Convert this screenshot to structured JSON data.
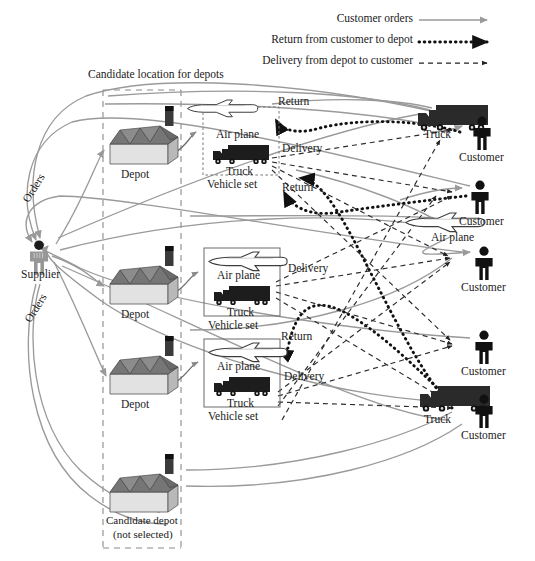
{
  "legend": {
    "items": [
      {
        "label": "Customer orders",
        "style": "solid-gray-arrow",
        "color": "#9a9a9a"
      },
      {
        "label": "Return from customer to depot",
        "style": "thick-dotted-black-arrow",
        "color": "#111111"
      },
      {
        "label": "Delivery from depot to customer",
        "style": "thin-dashed-black-arrow",
        "color": "#222222"
      }
    ]
  },
  "zone": {
    "title": "Candidate location for depots"
  },
  "supplier": {
    "label": "Supplier",
    "icon": "person-icon",
    "color": "#8d8d8d"
  },
  "order_labels": [
    {
      "label": "Orders"
    },
    {
      "label": "Orders"
    }
  ],
  "depots": [
    {
      "label": "Depot",
      "icon": "factory-icon",
      "selected": true
    },
    {
      "label": "Depot",
      "icon": "factory-icon",
      "selected": true
    },
    {
      "label": "Depot",
      "icon": "factory-icon",
      "selected": true
    },
    {
      "label": "Candidate depot",
      "sublabel": "(not selected)",
      "icon": "factory-icon",
      "selected": false
    }
  ],
  "vehicle_sets": [
    {
      "caption": "Vehicle set",
      "air_label": "Air plane",
      "truck_label": "Truck",
      "border": "dashed"
    },
    {
      "caption": "Vehicle set",
      "air_label": "Air plane",
      "truck_label": "Truck",
      "border": "solid"
    },
    {
      "caption": "Vehicle set",
      "air_label": "Air plane",
      "truck_label": "Truck",
      "border": "solid"
    }
  ],
  "flow_labels": [
    {
      "label": "Return",
      "kind": "return"
    },
    {
      "label": "Delivery",
      "kind": "delivery"
    },
    {
      "label": "Return",
      "kind": "return"
    },
    {
      "label": "Delivery",
      "kind": "delivery"
    },
    {
      "label": "Return",
      "kind": "return"
    },
    {
      "label": "Delivery",
      "kind": "delivery"
    }
  ],
  "field_vehicles": [
    {
      "label": "Truck",
      "icon": "truck-icon"
    },
    {
      "label": "Air plane",
      "icon": "airplane-icon"
    },
    {
      "label": "Truck",
      "icon": "truck-icon"
    }
  ],
  "customers": [
    {
      "label": "Customer",
      "icon": "person-icon"
    },
    {
      "label": "Customer",
      "icon": "person-icon"
    },
    {
      "label": "Customer",
      "icon": "person-icon"
    },
    {
      "label": "Customer",
      "icon": "person-icon"
    },
    {
      "label": "Customer",
      "icon": "person-icon"
    }
  ],
  "colors": {
    "order_flow": "#9a9a9a",
    "return_flow": "#111111",
    "delivery_flow": "#2b2b2b",
    "zone_dash": "#8a8a8a",
    "factory_dark": "#6f6f6f",
    "factory_light": "#d9d9d9",
    "truck_dark": "#1c1c1c",
    "person_dark": "#111111"
  }
}
